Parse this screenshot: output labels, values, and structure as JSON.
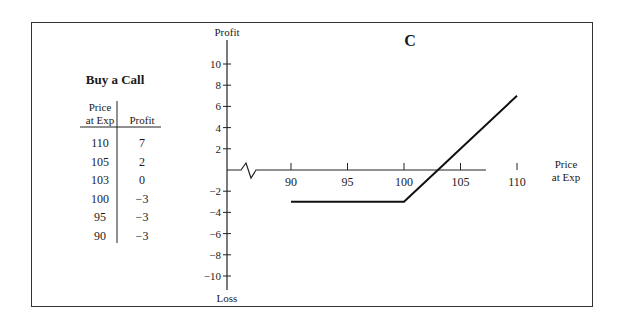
{
  "panel_label": "C",
  "table": {
    "title": "Buy a Call",
    "headers": [
      "Price at Exp",
      "Profit"
    ],
    "header_lines": [
      [
        "Price",
        "at Exp"
      ],
      [
        "Profit"
      ]
    ],
    "rows": [
      {
        "price": "110",
        "profit": "7"
      },
      {
        "price": "105",
        "profit": "2"
      },
      {
        "price": "103",
        "profit": "0"
      },
      {
        "price": "100",
        "profit": "−3"
      },
      {
        "price": "95",
        "profit": "−3"
      },
      {
        "price": "90",
        "profit": "−3"
      }
    ]
  },
  "axes": {
    "y_top_label": "Profit",
    "y_bottom_label": "Loss",
    "x_label_line1": "Price",
    "x_label_line2": "at Exp"
  },
  "chart_data": {
    "type": "line",
    "title": "C",
    "xlabel": "Price at Exp",
    "ylabel": "Profit / Loss",
    "x_ticks": [
      90,
      95,
      100,
      105,
      110
    ],
    "y_ticks": [
      10,
      8,
      6,
      4,
      2,
      -2,
      -4,
      -6,
      -8,
      -10
    ],
    "ylim": [
      -11,
      11
    ],
    "xlim": [
      90,
      112
    ],
    "axis_break": true,
    "series": [
      {
        "name": "Buy a Call",
        "x": [
          90,
          95,
          100,
          103,
          105,
          110
        ],
        "y": [
          -3,
          -3,
          -3,
          0,
          2,
          7
        ]
      }
    ],
    "grid": false
  }
}
